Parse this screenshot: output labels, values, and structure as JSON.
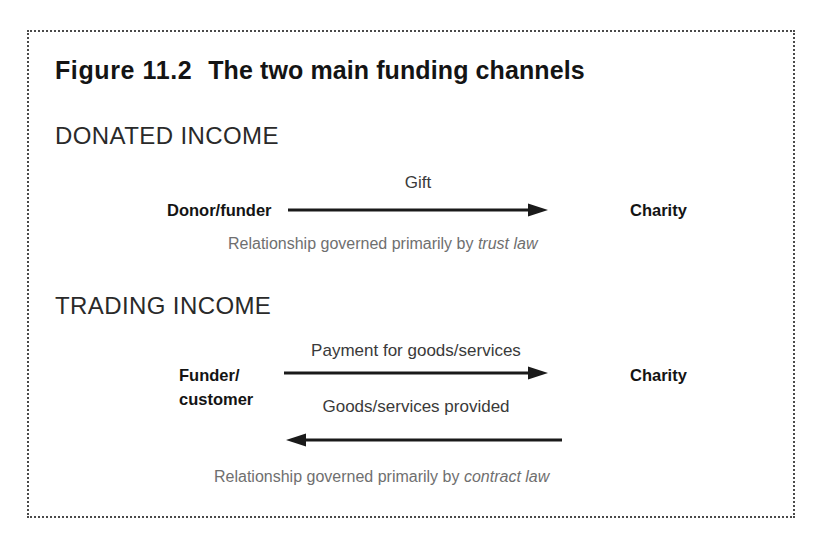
{
  "figure": {
    "number": "Figure 11.2",
    "title": "The two main funding channels",
    "frame_style": "dotted-border",
    "frame_color": "#4a4a4a"
  },
  "sections": {
    "donated": {
      "heading": "DONATED INCOME",
      "source_label": "Donor/funder",
      "target_label": "Charity",
      "arrow_label": "Gift",
      "arrow_direction": "right",
      "caption_prefix": "Relationship governed primarily by ",
      "caption_emphasis": "trust law"
    },
    "trading": {
      "heading": "TRADING INCOME",
      "source_label_line1": "Funder/",
      "source_label_line2": "customer",
      "target_label": "Charity",
      "arrow_label_forward": "Payment for goods/services",
      "arrow_label_backward": "Goods/services provided",
      "arrow_forward_direction": "right",
      "arrow_backward_direction": "left",
      "caption_prefix": "Relationship governed primarily by ",
      "caption_emphasis": "contract law"
    }
  },
  "colors": {
    "text_primary": "#141414",
    "text_label": "#3a3a3a",
    "text_caption": "#6f6f6f",
    "arrow": "#1a1a1a",
    "background": "#ffffff"
  }
}
